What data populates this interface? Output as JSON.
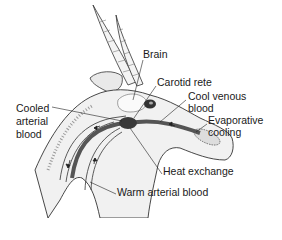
{
  "diagram": {
    "labels": {
      "brain": "Brain",
      "carotid_rete": "Carotid rete",
      "cool_venous_blood_line1": "Cool venous",
      "cool_venous_blood_line2": "blood",
      "evaporative_cooling_line1": "Evaporative",
      "evaporative_cooling_line2": "cooling",
      "cooled_arterial_blood_line1": "Cooled",
      "cooled_arterial_blood_line2": "arterial",
      "cooled_arterial_blood_line3": "blood",
      "heat_exchange": "Heat exchange",
      "warm_arterial_blood": "Warm arterial blood"
    },
    "colors": {
      "ink": "#1a1a1a",
      "vessel": "#555555",
      "rete": "#3a3a3a",
      "background": "#ffffff"
    }
  }
}
